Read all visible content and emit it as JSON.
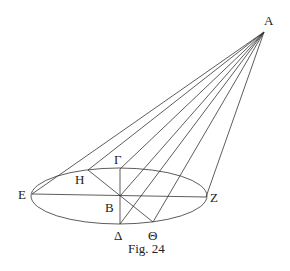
{
  "figure": {
    "caption": "Fig. 24",
    "apex": {
      "label": "A",
      "x": 264,
      "y": 32
    },
    "ellipse": {
      "cx": 119,
      "cy": 196,
      "rx": 88,
      "ry": 28
    },
    "points": [
      {
        "label": "E",
        "x": 32,
        "y": 194
      },
      {
        "label": "Η",
        "x": 88,
        "y": 170
      },
      {
        "label": "Γ",
        "x": 120,
        "y": 169
      },
      {
        "label": "B",
        "x": 120,
        "y": 196
      },
      {
        "label": "Δ",
        "x": 120,
        "y": 224
      },
      {
        "label": "Θ",
        "x": 153,
        "y": 222
      },
      {
        "label": "Z",
        "x": 206,
        "y": 197
      }
    ],
    "labels": {
      "A": "A",
      "E": "E",
      "H": "Η",
      "G": "Γ",
      "B": "B",
      "D": "Δ",
      "Th": "Θ",
      "Z": "Z"
    }
  }
}
